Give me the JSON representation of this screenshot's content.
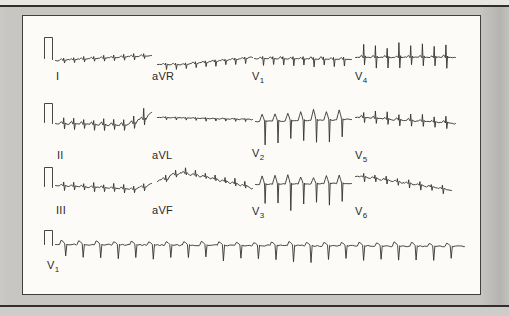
{
  "figure": {
    "kind": "scanned-textbook-ecg-figure",
    "page_bg": "#c7c6c2",
    "strip_bg": "#e8e6e1",
    "rule_color": "#302f2b",
    "panel_bg": "#fcfbf8",
    "panel_border": "#403f3b",
    "trace_color": "#33322e",
    "label_color": "#2a2927"
  },
  "chart_data": {
    "type": "line",
    "xlabel": "time",
    "ylabel": "voltage",
    "grid": false,
    "legend": "none",
    "layout": {
      "rows": 4,
      "row_baselines_px": [
        60,
        124,
        187,
        245
      ],
      "panel_px": {
        "left": 22,
        "top": 15,
        "width": 457,
        "height": 278
      }
    },
    "calibration_pulses": [
      {
        "x": 45,
        "width": 8,
        "top": 38,
        "base": 60
      },
      {
        "x": 45,
        "width": 8,
        "top": 104,
        "base": 124
      },
      {
        "x": 45,
        "width": 8,
        "top": 168,
        "base": 188
      },
      {
        "x": 45,
        "width": 8,
        "top": 231,
        "base": 246
      }
    ],
    "leads": [
      {
        "label": "I",
        "sub": "",
        "label_x": 55,
        "label_y": 69,
        "row": 1,
        "x": [
          56,
          152
        ],
        "baseline": 60,
        "beats": 9,
        "up": 2.5,
        "down": 3,
        "bump": 1.2,
        "noise": 0.7,
        "drift": [
          [
            0,
            1
          ],
          [
            1,
            -4
          ]
        ],
        "seed": 3,
        "morphology": "low-amplitude complexes, slight upward drift"
      },
      {
        "label": "aVR",
        "sub": "",
        "label_x": 151,
        "label_y": 69,
        "row": 1,
        "x": [
          158,
          253
        ],
        "baseline": 63,
        "beats": 9,
        "up": 1.5,
        "down": 4.5,
        "bump": 1,
        "noise": 0.6,
        "drift": [
          [
            0,
            2
          ],
          [
            0.25,
            2
          ],
          [
            1,
            -5
          ]
        ],
        "seed": 5,
        "morphology": "small negative deflections, flat start"
      },
      {
        "label": "V",
        "sub": "1",
        "label_x": 251,
        "label_y": 69,
        "row": 1,
        "x": [
          255,
          352
        ],
        "baseline": 59,
        "beats": 9,
        "up": 2,
        "down": 7,
        "bump": 2,
        "noise": 0.6,
        "drift": [
          [
            0,
            0
          ],
          [
            1,
            1
          ]
        ],
        "seed": 7,
        "morphology": "rS complexes with small downward spikes"
      },
      {
        "label": "V",
        "sub": "4",
        "label_x": 354,
        "label_y": 69,
        "row": 1,
        "x": [
          356,
          456
        ],
        "baseline": 58,
        "beats": 8,
        "up": 12,
        "down": 9,
        "bump": 2,
        "noise": 0.6,
        "drift": [
          [
            0,
            0
          ],
          [
            1,
            0
          ]
        ],
        "seed": 9,
        "morphology": "biphasic RS complexes, taller spikes"
      },
      {
        "label": "II",
        "sub": "",
        "label_x": 56,
        "label_y": 148,
        "row": 2,
        "x": [
          56,
          152
        ],
        "baseline": 124,
        "beats": 9,
        "up": 5,
        "down": 5,
        "bump": 2.5,
        "noise": 0.8,
        "drift": [
          [
            0,
            0
          ],
          [
            0.72,
            2
          ],
          [
            0.9,
            -5
          ],
          [
            1,
            -11
          ]
        ],
        "accents": {
          "7": 2.0,
          "8": 2.4
        },
        "seed": 11,
        "morphology": "small qR complexes, baseline rises with two tall spikes at end"
      },
      {
        "label": "aVL",
        "sub": "",
        "label_x": 151,
        "label_y": 148,
        "row": 2,
        "x": [
          158,
          253
        ],
        "baseline": 118,
        "beats": 9,
        "up": 0.8,
        "down": 2.5,
        "bump": 0.5,
        "noise": 0.45,
        "drift": [
          [
            0,
            0
          ],
          [
            1,
            2
          ]
        ],
        "seed": 13,
        "morphology": "nearly flat trace with tiny notches"
      },
      {
        "label": "V",
        "sub": "2",
        "label_x": 251,
        "label_y": 146,
        "row": 2,
        "x": [
          256,
          352
        ],
        "baseline": 121,
        "type": "deepS",
        "beats": 7,
        "peak": 9,
        "down": 21,
        "noise": 0.7,
        "drift": [
          [
            0,
            1
          ],
          [
            1,
            -1
          ]
        ],
        "seed": 15,
        "morphology": "rounded R peaks with very deep narrow S waves"
      },
      {
        "label": "V",
        "sub": "5",
        "label_x": 354,
        "label_y": 148,
        "row": 2,
        "x": [
          356,
          456
        ],
        "baseline": 120,
        "beats": 8,
        "up": 6,
        "down": 5,
        "bump": 2,
        "noise": 0.7,
        "drift": [
          [
            0,
            -2
          ],
          [
            1,
            4
          ]
        ],
        "seed": 17,
        "morphology": "moderate RS complexes drifting slightly down"
      },
      {
        "label": "III",
        "sub": "",
        "label_x": 55,
        "label_y": 203,
        "row": 3,
        "x": [
          56,
          152
        ],
        "baseline": 186,
        "beats": 9,
        "up": 4,
        "down": 4,
        "bump": 1.5,
        "noise": 0.8,
        "drift": [
          [
            0,
            0
          ],
          [
            0.8,
            4
          ],
          [
            1,
            -2
          ]
        ],
        "seed": 19,
        "morphology": "small complexes with mild baseline sag"
      },
      {
        "label": "aVF",
        "sub": "",
        "label_x": 151,
        "label_y": 203,
        "row": 3,
        "x": [
          158,
          253
        ],
        "baseline": 186,
        "beats": 9,
        "up": 4.5,
        "down": 2,
        "bump": 1.5,
        "noise": 0.8,
        "drift": [
          [
            0,
            -4
          ],
          [
            0.2,
            -13
          ],
          [
            0.45,
            -9
          ],
          [
            1,
            3
          ]
        ],
        "seed": 21,
        "morphology": "baseline hump early in strip with small upward spikes"
      },
      {
        "label": "V",
        "sub": "3",
        "label_x": 251,
        "label_y": 204,
        "row": 3,
        "x": [
          256,
          352
        ],
        "baseline": 184,
        "type": "deepS",
        "beats": 7,
        "peak": 8,
        "down": 22,
        "noise": 0.7,
        "drift": [
          [
            0,
            1
          ],
          [
            1,
            0
          ]
        ],
        "seed": 23,
        "morphology": "rounded R peaks with very deep narrow S waves"
      },
      {
        "label": "V",
        "sub": "6",
        "label_x": 354,
        "label_y": 204,
        "row": 3,
        "x": [
          356,
          452
        ],
        "baseline": 186,
        "beats": 8,
        "up": 3,
        "down": 4.5,
        "bump": 1,
        "noise": 0.6,
        "drift": [
          [
            0,
            -9
          ],
          [
            0.12,
            -8
          ],
          [
            1,
            5
          ]
        ],
        "seed": 25,
        "morphology": "starts on elevated plateau then small complexes descending"
      },
      {
        "label": "V",
        "sub": "1",
        "label_x": 46,
        "label_y": 258,
        "row": 4,
        "x": [
          56,
          465
        ],
        "baseline": 245,
        "type": "rhythm",
        "beats": 23,
        "bump": 3.5,
        "downProfile": [
          [
            0,
            12
          ],
          [
            0.3,
            13
          ],
          [
            0.52,
            16
          ],
          [
            0.75,
            13
          ],
          [
            1,
            14
          ]
        ],
        "noise": 0.7,
        "drift": [
          [
            0,
            0
          ],
          [
            1,
            2
          ]
        ],
        "seed": 27,
        "morphology": "continuous rhythm strip: rounded bumps with regular sharp downward spikes, rate fast (~23 beats across strip)"
      }
    ]
  }
}
